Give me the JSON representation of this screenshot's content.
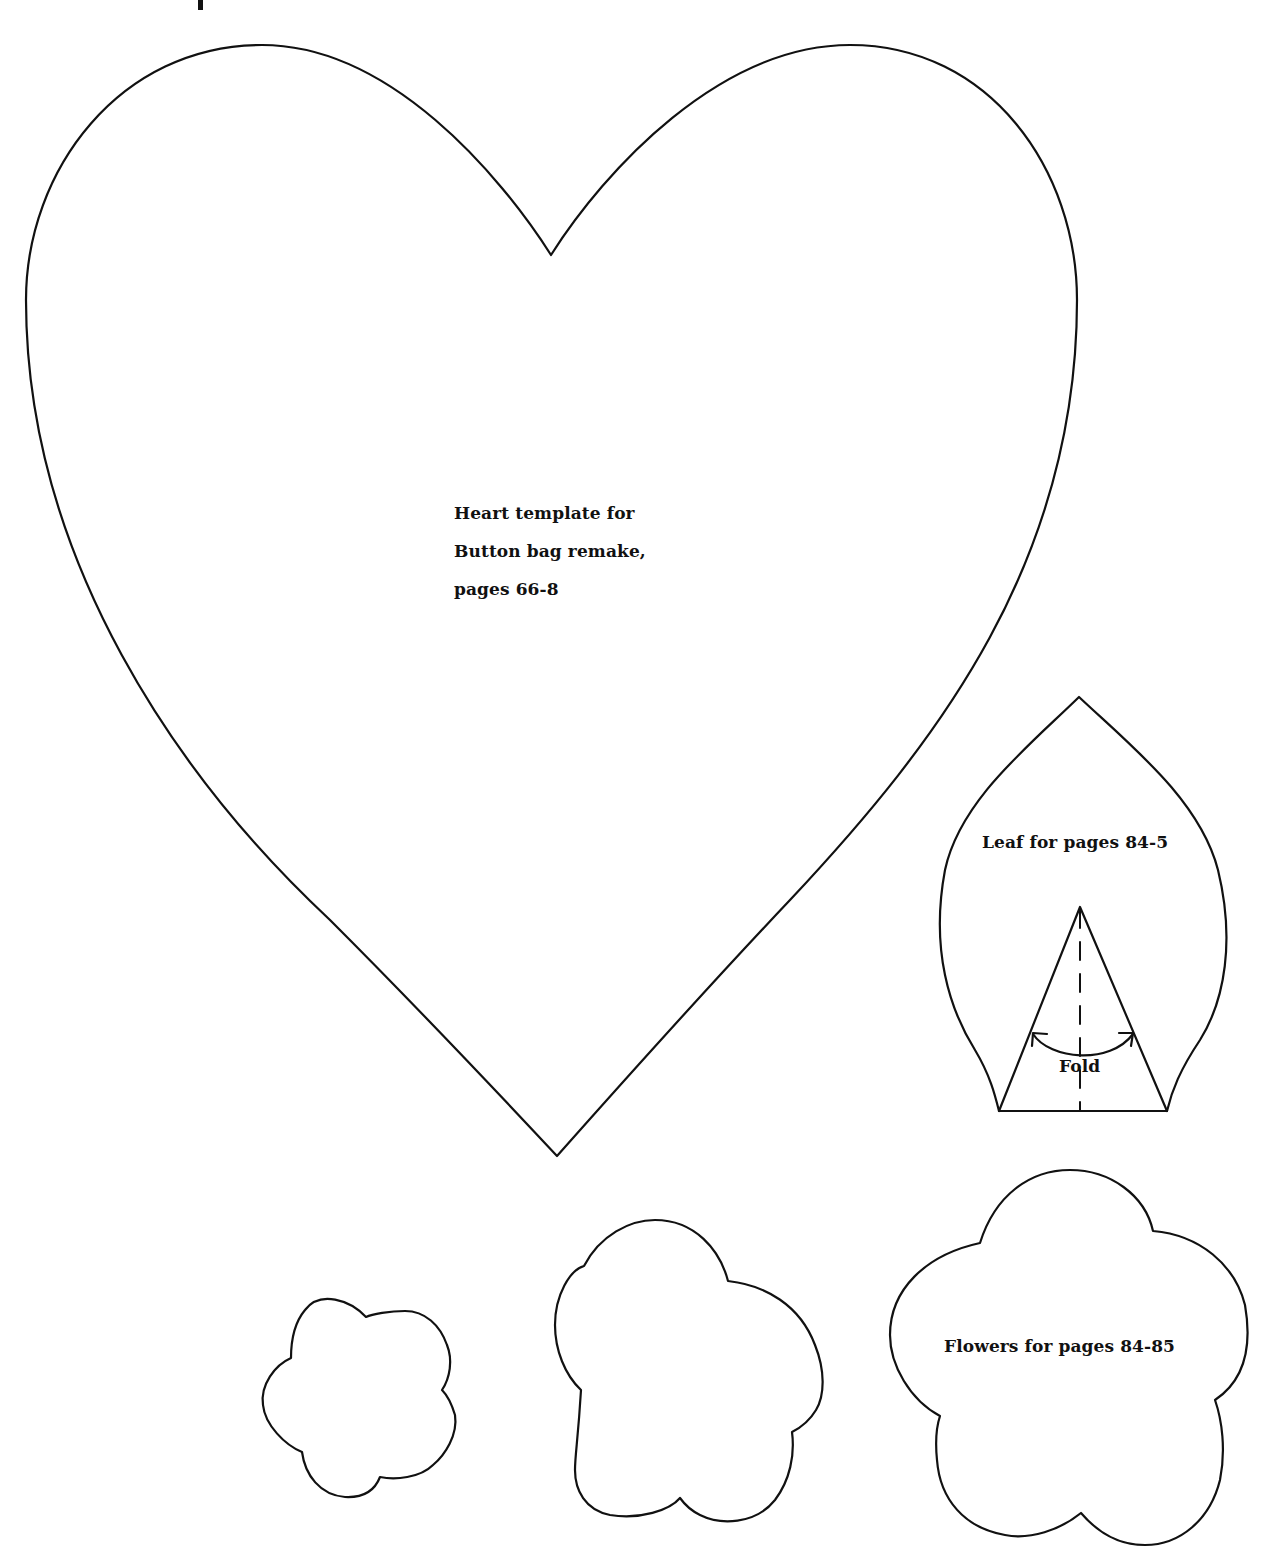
{
  "page": {
    "background": "#ffffff",
    "stroke_color": "#111111"
  },
  "heart": {
    "label_lines": [
      "Heart template for",
      "Button bag remake,",
      "pages 66-8"
    ]
  },
  "leaf": {
    "label": "Leaf for pages 84-5",
    "fold_label": "Fold"
  },
  "flowers": {
    "label": "Flowers for pages 84-85",
    "sizes": [
      "small",
      "medium",
      "large"
    ]
  }
}
